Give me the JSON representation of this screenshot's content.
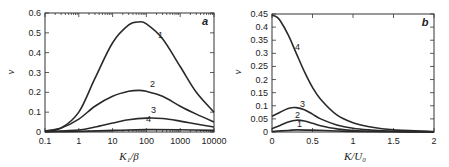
{
  "chart_data": [
    {
      "panel": "a",
      "type": "line",
      "xscale": "log",
      "xlabel": "K₁/β",
      "ylabel": "v",
      "xlim": [
        0.1,
        10000
      ],
      "ylim": [
        0,
        0.6
      ],
      "xticks": [
        "0.1",
        "1",
        "10",
        "100",
        "1000",
        "10000"
      ],
      "yticks": [
        "0",
        "0.1",
        "0.2",
        "0.3",
        "0.4",
        "0.5",
        "0.6"
      ],
      "grid": false,
      "series": [
        {
          "name": "1",
          "x": [
            0.1,
            0.3,
            1,
            3,
            10,
            30,
            60,
            100,
            300,
            1000,
            3000,
            10000
          ],
          "y": [
            0.005,
            0.02,
            0.1,
            0.27,
            0.45,
            0.54,
            0.555,
            0.545,
            0.47,
            0.33,
            0.2,
            0.1
          ]
        },
        {
          "name": "2",
          "x": [
            0.1,
            0.3,
            1,
            3,
            10,
            30,
            60,
            100,
            300,
            1000,
            3000,
            10000
          ],
          "y": [
            0.005,
            0.02,
            0.065,
            0.13,
            0.18,
            0.205,
            0.21,
            0.205,
            0.18,
            0.13,
            0.09,
            0.05
          ]
        },
        {
          "name": "3",
          "x": [
            0.1,
            1,
            3,
            10,
            30,
            100,
            300,
            1000,
            3000,
            10000
          ],
          "y": [
            0.002,
            0.01,
            0.025,
            0.045,
            0.062,
            0.07,
            0.068,
            0.055,
            0.04,
            0.025
          ]
        },
        {
          "name": "4",
          "x": [
            0.1,
            1,
            10,
            100,
            1000,
            10000
          ],
          "y": [
            0.001,
            0.003,
            0.008,
            0.012,
            0.011,
            0.008
          ]
        }
      ]
    },
    {
      "panel": "b",
      "type": "line",
      "xlabel": "K/U₀",
      "ylabel": "v",
      "xlim": [
        0,
        2
      ],
      "ylim": [
        0,
        0.45
      ],
      "xticks": [
        "0",
        "0.5",
        "1",
        "1.5",
        "2"
      ],
      "yticks": [
        "0",
        "0.05",
        "0.1",
        "0.15",
        "0.2",
        "0.25",
        "0.3",
        "0.35",
        "0.4",
        "0.45"
      ],
      "grid": false,
      "series": [
        {
          "name": "4",
          "x": [
            0,
            0.05,
            0.1,
            0.2,
            0.3,
            0.4,
            0.5,
            0.6,
            0.8,
            1.0,
            1.2,
            1.5,
            2.0
          ],
          "y": [
            0.445,
            0.44,
            0.425,
            0.37,
            0.3,
            0.23,
            0.17,
            0.125,
            0.065,
            0.035,
            0.02,
            0.008,
            0.002
          ]
        },
        {
          "name": "3",
          "x": [
            0,
            0.1,
            0.2,
            0.3,
            0.4,
            0.5,
            0.6,
            0.8,
            1.0,
            1.2,
            1.5,
            2.0
          ],
          "y": [
            0.06,
            0.075,
            0.09,
            0.093,
            0.085,
            0.068,
            0.05,
            0.027,
            0.014,
            0.008,
            0.003,
            0.001
          ]
        },
        {
          "name": "2",
          "x": [
            0,
            0.1,
            0.2,
            0.3,
            0.4,
            0.5,
            0.6,
            0.8,
            1.0,
            1.5,
            2.0
          ],
          "y": [
            0.013,
            0.025,
            0.038,
            0.045,
            0.042,
            0.033,
            0.024,
            0.012,
            0.006,
            0.002,
            0.0005
          ]
        },
        {
          "name": "1",
          "x": [
            0,
            0.2,
            0.3,
            0.5,
            0.8,
            1.0,
            1.5,
            2.0
          ],
          "y": [
            0.002,
            0.006,
            0.008,
            0.007,
            0.004,
            0.002,
            0.001,
            0.0
          ]
        }
      ]
    }
  ]
}
